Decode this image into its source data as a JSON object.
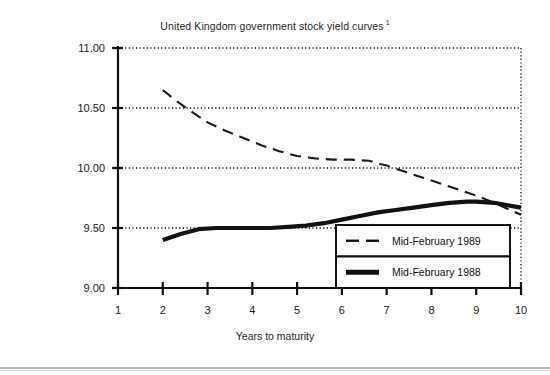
{
  "chart_data": {
    "type": "line",
    "title": "United Kingdom government stock yield curves",
    "title_footnote": "1",
    "xlabel": "Years to maturity",
    "ylabel": "",
    "xlim": [
      1,
      10
    ],
    "ylim": [
      9.0,
      11.0
    ],
    "xticks": [
      1,
      2,
      3,
      4,
      5,
      6,
      7,
      8,
      9,
      10
    ],
    "xtick_labels": [
      "1",
      "2",
      "3",
      "4",
      "5",
      "6",
      "7",
      "8",
      "9",
      "10"
    ],
    "yticks": [
      9.0,
      9.5,
      10.0,
      10.5,
      11.0
    ],
    "ytick_labels": [
      "9.00",
      "9.50",
      "10.00",
      "10.50",
      "11.00"
    ],
    "grid": "horizontal-dotted",
    "legend_position": "bottom-right",
    "series": [
      {
        "name": "Mid-February 1989",
        "style": "dashed",
        "color": "#1a1a1a",
        "width": 2.1,
        "x": [
          2.0,
          2.3,
          2.6,
          3.0,
          3.4,
          3.8,
          4.2,
          4.6,
          5.0,
          5.4,
          5.8,
          6.2,
          6.6,
          7.0,
          7.4,
          7.8,
          8.2,
          8.6,
          9.0,
          9.4,
          9.7,
          10.0
        ],
        "y": [
          10.65,
          10.56,
          10.48,
          10.38,
          10.31,
          10.25,
          10.19,
          10.14,
          10.1,
          10.08,
          10.07,
          10.07,
          10.06,
          10.02,
          9.97,
          9.92,
          9.87,
          9.82,
          9.77,
          9.71,
          9.66,
          9.61
        ]
      },
      {
        "name": "Mid-February 1988",
        "style": "solid",
        "color": "#111111",
        "width": 4.2,
        "x": [
          2.0,
          2.4,
          2.8,
          3.2,
          3.6,
          4.0,
          4.4,
          4.8,
          5.2,
          5.6,
          6.0,
          6.4,
          6.8,
          7.2,
          7.6,
          8.0,
          8.4,
          8.8,
          9.0,
          9.4,
          9.7,
          10.0
        ],
        "y": [
          9.4,
          9.45,
          9.49,
          9.5,
          9.5,
          9.5,
          9.5,
          9.51,
          9.52,
          9.54,
          9.57,
          9.6,
          9.63,
          9.65,
          9.67,
          9.69,
          9.71,
          9.72,
          9.72,
          9.71,
          9.69,
          9.67
        ]
      }
    ]
  },
  "legend": {
    "rows": [
      {
        "label": "Mid-February 1989",
        "style": "dashed"
      },
      {
        "label": "Mid-February 1988",
        "style": "solid"
      }
    ]
  }
}
